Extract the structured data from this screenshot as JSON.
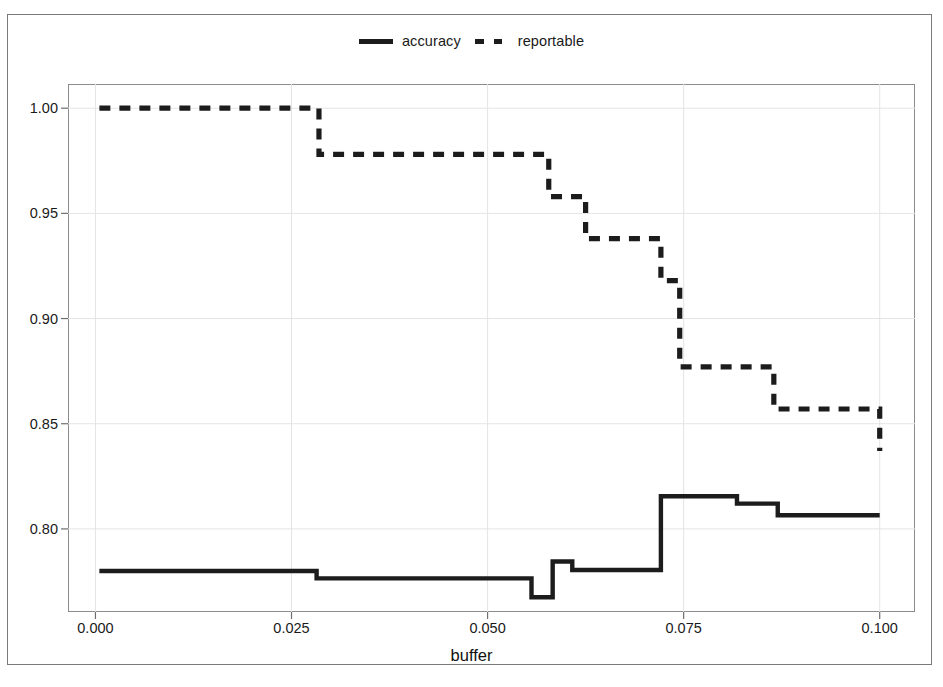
{
  "chart_data": {
    "type": "line",
    "title": "",
    "xlabel": "buffer",
    "ylabel": "",
    "xlim": [
      -0.0035,
      0.1045
    ],
    "ylim": [
      0.7605,
      1.0115
    ],
    "xticks": [
      0.0,
      0.025,
      0.05,
      0.075,
      0.1
    ],
    "xticklabels": [
      "0.000",
      "0.025",
      "0.050",
      "0.075",
      "0.100"
    ],
    "yticks": [
      0.8,
      0.85,
      0.9,
      0.95,
      1.0
    ],
    "yticklabels": [
      "0.80",
      "0.85",
      "0.90",
      "0.95",
      "1.00"
    ],
    "grid": true,
    "legend_position": "top-center",
    "drawstyle": "steps-post",
    "series": [
      {
        "name": "accuracy",
        "style": "solid",
        "color": "#1c1c1c",
        "x": [
          0.0005,
          0.0282,
          0.053,
          0.0556,
          0.0583,
          0.0608,
          0.0721,
          0.08,
          0.0818,
          0.087,
          0.1
        ],
        "y": [
          0.78,
          0.7765,
          0.7765,
          0.7675,
          0.7845,
          0.7805,
          0.8155,
          0.8155,
          0.812,
          0.8065,
          0.8065
        ]
      },
      {
        "name": "reportable",
        "style": "dashed",
        "color": "#1c1c1c",
        "x": [
          0.0005,
          0.0285,
          0.0553,
          0.0578,
          0.0625,
          0.0721,
          0.0745,
          0.0818,
          0.0865,
          0.1
        ],
        "y": [
          1.0,
          0.978,
          0.978,
          0.958,
          0.938,
          0.918,
          0.877,
          0.877,
          0.857,
          0.837
        ]
      }
    ]
  },
  "legend": {
    "entries": [
      {
        "label": "accuracy",
        "swatch": "solid-line-swatch"
      },
      {
        "label": "reportable",
        "swatch": "dashed-line-swatch"
      }
    ]
  },
  "axis": {
    "x_title": "buffer"
  }
}
